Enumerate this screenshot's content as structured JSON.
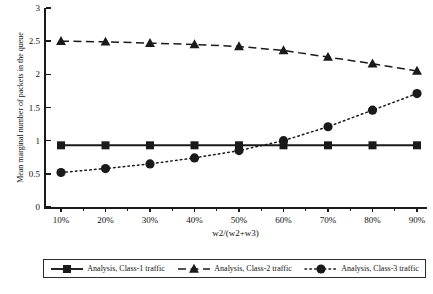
{
  "chart_data": {
    "type": "line",
    "title": "",
    "xlabel": "w2/(w2+w3)",
    "ylabel": "Mean marginal number of packets in the queue",
    "categories": [
      "10%",
      "20%",
      "30%",
      "40%",
      "50%",
      "60%",
      "70%",
      "80%",
      "90%"
    ],
    "x": [
      10,
      20,
      30,
      40,
      50,
      60,
      70,
      80,
      90
    ],
    "xlim": [
      10,
      90
    ],
    "ylim": [
      0,
      3
    ],
    "yticks": [
      "0",
      "0.5",
      "1",
      "1.5",
      "2",
      "2.5",
      "3"
    ],
    "ytick_values": [
      0,
      0.5,
      1,
      1.5,
      2,
      2.5,
      3
    ],
    "grid": false,
    "legend_position": "bottom",
    "series": [
      {
        "name": "Analysis, Class-1 traffic",
        "marker": "square",
        "linestyle": "solid",
        "color": "#1a1a1a",
        "values": [
          0.93,
          0.93,
          0.93,
          0.93,
          0.93,
          0.93,
          0.93,
          0.93,
          0.93
        ]
      },
      {
        "name": "Analysis, Class-2 traffic",
        "marker": "triangle",
        "linestyle": "dashed",
        "color": "#1a1a1a",
        "values": [
          2.5,
          2.49,
          2.47,
          2.45,
          2.42,
          2.36,
          2.26,
          2.16,
          2.05
        ]
      },
      {
        "name": "Analysis, Class-3 traffic",
        "marker": "circle",
        "linestyle": "dotted",
        "color": "#1a1a1a",
        "values": [
          0.52,
          0.58,
          0.65,
          0.74,
          0.85,
          1.0,
          1.21,
          1.46,
          1.71
        ]
      }
    ]
  },
  "axes": {
    "y_title": "Mean marginal number of packets in the queue",
    "x_title": "w2/(w2+w3)"
  },
  "legend": {
    "entries": [
      {
        "label": "Analysis, Class-1 traffic",
        "marker": "square-marker",
        "line": "solid-line"
      },
      {
        "label": "Analysis, Class-2 traffic",
        "marker": "triangle-marker",
        "line": "dashed-line"
      },
      {
        "label": "Analysis, Class-3 traffic",
        "marker": "circle-marker",
        "line": "dotted-line"
      }
    ]
  },
  "caption": ""
}
